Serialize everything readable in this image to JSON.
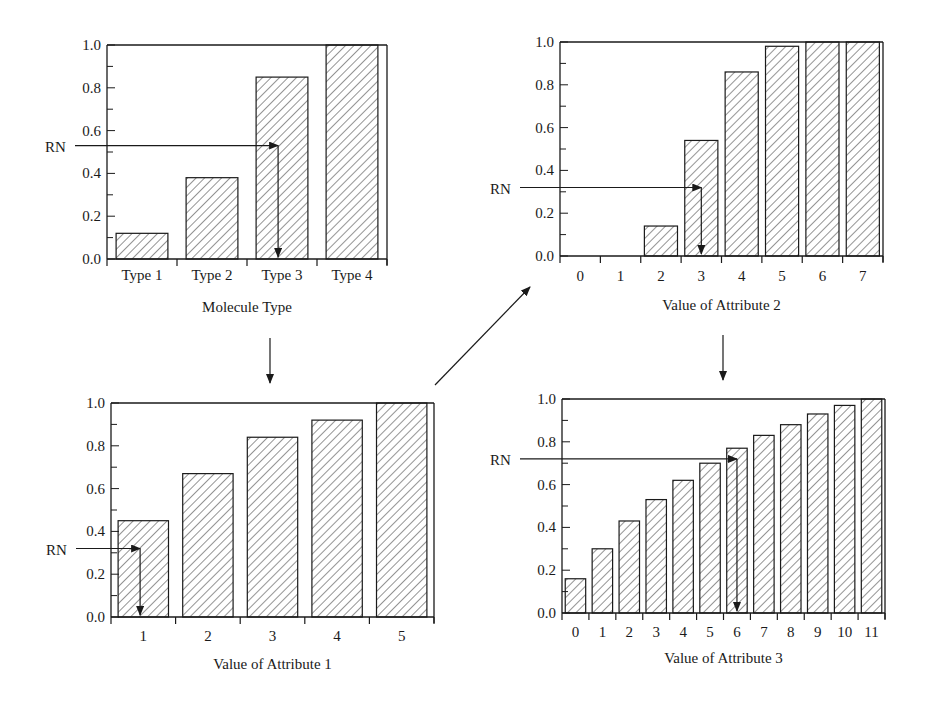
{
  "figure": {
    "rn_label": "RN",
    "colors": {
      "ink": "#1a1a1a",
      "background": "#ffffff",
      "hatch": "#2a2a2a"
    }
  },
  "chart_data": [
    {
      "id": "panel-molecule-type",
      "type": "bar",
      "title": "",
      "xlabel": "Molecule Type",
      "ylabel": "",
      "categories": [
        "Type 1",
        "Type 2",
        "Type 3",
        "Type 4"
      ],
      "values": [
        0.12,
        0.38,
        0.85,
        1.0
      ],
      "ylim": [
        0,
        1.0
      ],
      "yticks": [
        "0.0",
        "0.2",
        "0.4",
        "0.6",
        "0.8",
        "1.0"
      ],
      "grid": false,
      "pattern": "diagonal-hatch",
      "rn_value": 0.53,
      "rn_selected_category": "Type 3"
    },
    {
      "id": "panel-attribute-2",
      "type": "bar",
      "title": "",
      "xlabel": "Value of Attribute 2",
      "ylabel": "",
      "categories": [
        "0",
        "1",
        "2",
        "3",
        "4",
        "5",
        "6",
        "7"
      ],
      "values": [
        0.0,
        0.0,
        0.14,
        0.54,
        0.86,
        0.98,
        1.0,
        1.0
      ],
      "ylim": [
        0,
        1.0
      ],
      "yticks": [
        "0.0",
        "0.2",
        "0.4",
        "0.6",
        "0.8",
        "1.0"
      ],
      "grid": false,
      "pattern": "diagonal-hatch",
      "rn_value": 0.32,
      "rn_selected_category": "3"
    },
    {
      "id": "panel-attribute-1",
      "type": "bar",
      "title": "",
      "xlabel": "Value of Attribute 1",
      "ylabel": "",
      "categories": [
        "1",
        "2",
        "3",
        "4",
        "5"
      ],
      "values": [
        0.45,
        0.67,
        0.84,
        0.92,
        1.0
      ],
      "ylim": [
        0,
        1.0
      ],
      "yticks": [
        "0.0",
        "0.2",
        "0.4",
        "0.6",
        "0.8",
        "1.0"
      ],
      "grid": false,
      "pattern": "diagonal-hatch",
      "rn_value": 0.32,
      "rn_selected_category": "1"
    },
    {
      "id": "panel-attribute-3",
      "type": "bar",
      "title": "",
      "xlabel": "Value of Attribute 3",
      "ylabel": "",
      "categories": [
        "0",
        "1",
        "2",
        "3",
        "4",
        "5",
        "6",
        "7",
        "8",
        "9",
        "10",
        "11"
      ],
      "values": [
        0.16,
        0.3,
        0.43,
        0.53,
        0.62,
        0.7,
        0.77,
        0.83,
        0.88,
        0.93,
        0.97,
        1.0
      ],
      "ylim": [
        0,
        1.0
      ],
      "yticks": [
        "0.0",
        "0.2",
        "0.4",
        "0.6",
        "0.8",
        "1.0"
      ],
      "grid": false,
      "pattern": "diagonal-hatch",
      "rn_value": 0.72,
      "rn_selected_category": "6"
    }
  ],
  "layout": {
    "panels": [
      {
        "x0": 107,
        "x1": 387,
        "y0": 259,
        "y1": 45,
        "bar_frac": 0.74,
        "ticklabel_dy": 21,
        "xlabel_dy": 53
      },
      {
        "x0": 560,
        "x1": 883,
        "y0": 256,
        "y1": 42,
        "bar_frac": 0.82,
        "ticklabel_dy": 25,
        "xlabel_dy": 54
      },
      {
        "x0": 111,
        "x1": 434,
        "y0": 617,
        "y1": 403,
        "bar_frac": 0.78,
        "ticklabel_dy": 24,
        "xlabel_dy": 52
      },
      {
        "x0": 562,
        "x1": 885,
        "y0": 613,
        "y1": 399,
        "bar_frac": 0.76,
        "ticklabel_dy": 24,
        "xlabel_dy": 50
      }
    ],
    "rn_label_x": [
      45,
      490,
      46,
      490
    ],
    "connectors": [
      {
        "x1": 270,
        "y1": 338,
        "x2": 270,
        "y2": 383
      },
      {
        "x1": 435,
        "y1": 385,
        "x2": 530,
        "y2": 287
      },
      {
        "x1": 723,
        "y1": 335,
        "x2": 723,
        "y2": 380
      }
    ]
  }
}
